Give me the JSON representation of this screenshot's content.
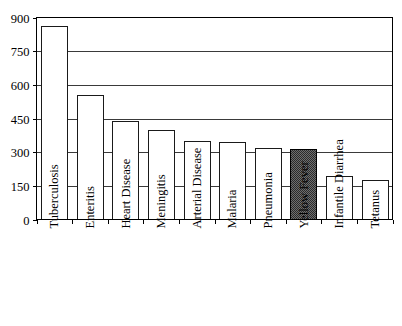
{
  "chart_data": {
    "type": "bar",
    "title": "",
    "subtitle": "",
    "xlabel": "",
    "ylabel": "",
    "categories": [
      "Tuberculosis",
      "Enteritis",
      "Heart Disease",
      "Meningitis",
      "Arterial Disease",
      "Malaria",
      "Pneumonia",
      "Yellow Fever",
      "Infantile Diarrhea",
      "Tetanus"
    ],
    "values": [
      860,
      555,
      440,
      398,
      348,
      345,
      320,
      312,
      192,
      178
    ],
    "highlight_index": 7,
    "highlight_label": "Yellow Fever",
    "ylim": [
      0,
      900
    ],
    "yticks": [
      0,
      150,
      300,
      450,
      600,
      750,
      900
    ],
    "ytick_labels": [
      "0",
      "150",
      "300",
      "450",
      "600",
      "750",
      "900"
    ],
    "grid": true,
    "grid_axis": "y",
    "legend": false,
    "legend_position": "none",
    "annotations": [],
    "series": [
      {
        "name": "deaths",
        "values": [
          860,
          555,
          440,
          398,
          348,
          345,
          320,
          312,
          192,
          178
        ]
      }
    ],
    "bar_fill_default": "#ffffff",
    "bar_fill_highlight": "#4a4a4a",
    "bar_stroke": "#1a1a1a",
    "label_rotation": -90
  },
  "axes": {
    "y_axis_name": "y-axis",
    "x_axis_name": "x-axis"
  }
}
